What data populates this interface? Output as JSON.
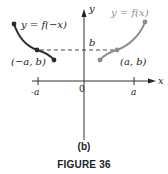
{
  "figure": {
    "subfigure_label": "(b)",
    "caption": "FIGURE 36"
  },
  "axes": {
    "x_label": "x",
    "y_label": "y",
    "origin_label": "0",
    "x_ticks": [
      "-a",
      "a"
    ],
    "y_ticks": [
      "b"
    ]
  },
  "curves": [
    {
      "name": "reflected",
      "label": "y = f(−x)",
      "point_label": "(−a, b)",
      "color": "#2a2a2a"
    },
    {
      "name": "original",
      "label": "y = f(x)",
      "point_label": "(a, b)",
      "color": "#8c8c8c"
    }
  ],
  "colors": {
    "axis": "#333333",
    "dashed": "#333333",
    "text": "#222222"
  }
}
